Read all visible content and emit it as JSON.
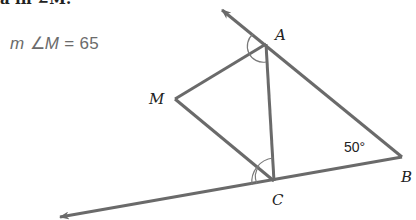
{
  "header": {
    "cut_text": "a  in  ∠M."
  },
  "answer": {
    "prefix": "m",
    "angle_symbol": "∠",
    "vertex": "M",
    "equals": "=",
    "value": "65"
  },
  "figure": {
    "points": {
      "A": {
        "label": "A",
        "x": 266,
        "y": 44
      },
      "B": {
        "label": "B",
        "x": 402,
        "y": 157
      },
      "C": {
        "label": "C",
        "x": 274,
        "y": 181
      },
      "M": {
        "label": "M",
        "x": 175,
        "y": 99
      }
    },
    "given_angle": {
      "vertex": "B",
      "label": "50°"
    },
    "rays": [
      {
        "from": "B",
        "through": "A",
        "arrow": true
      },
      {
        "from": "B",
        "through": "C",
        "arrow": true
      }
    ],
    "segments": [
      "AC",
      "AM",
      "MC"
    ],
    "angle_marks": [
      {
        "vertex": "A",
        "type": "single-arc",
        "note": "AM bisects exterior angle at A"
      },
      {
        "vertex": "C",
        "type": "double-arc",
        "note": "CM bisects exterior angle at C"
      }
    ],
    "line_color": "#6a6a6a",
    "arc_color": "#7a7a7a"
  }
}
